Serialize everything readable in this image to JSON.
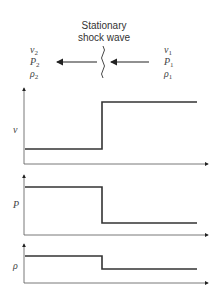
{
  "title_line1": "Stationary",
  "title_line2": "shock wave",
  "left_state": {
    "v": "v",
    "P": "P",
    "rho": "ρ",
    "sub": "2"
  },
  "right_state": {
    "v": "v",
    "P": "P",
    "rho": "ρ",
    "sub": "1"
  },
  "plots": [
    {
      "label": "v",
      "before": "low",
      "after": "high"
    },
    {
      "label": "P",
      "before": "high",
      "after": "low"
    },
    {
      "label": "ρ",
      "before": "high",
      "after": "low"
    }
  ]
}
